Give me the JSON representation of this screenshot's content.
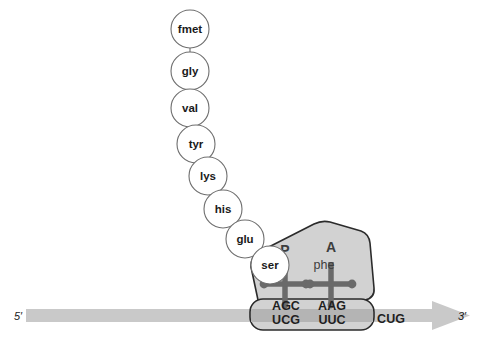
{
  "diagram": {
    "polypeptide": {
      "name": "growing-polypeptide-chain",
      "residues": [
        {
          "label": "fmet",
          "cx": 190,
          "cy": 29
        },
        {
          "label": "gly",
          "cx": 190,
          "cy": 71
        },
        {
          "label": "val",
          "cx": 190,
          "cy": 108
        },
        {
          "label": "tyr",
          "cx": 196,
          "cy": 144
        },
        {
          "label": "lys",
          "cx": 208,
          "cy": 176
        },
        {
          "label": "his",
          "cx": 223,
          "cy": 209
        },
        {
          "label": "glu",
          "cx": 245,
          "cy": 239
        },
        {
          "label": "ser",
          "cx": 270,
          "cy": 265
        }
      ],
      "radius": 19
    },
    "ribosome": {
      "large_subunit_name": "ribosome-large-subunit",
      "small_subunit_name": "ribosome-small-subunit",
      "sites": [
        {
          "id": "P",
          "label": "P",
          "x": 285,
          "y": 252
        },
        {
          "id": "A",
          "label": "A",
          "x": 331,
          "y": 249
        }
      ],
      "incoming_amino_acid": {
        "label": "phe",
        "x": 325,
        "y": 266
      }
    },
    "trnas": [
      {
        "name": "trna-p-site",
        "cx": 285,
        "cy": 285,
        "anticodon": "AGC"
      },
      {
        "name": "trna-a-site",
        "cx": 331,
        "cy": 285,
        "anticodon": "AAG"
      }
    ],
    "anticodons": [
      {
        "text": "AGC",
        "x": 286,
        "y": 309
      },
      {
        "text": "AAG",
        "x": 332,
        "y": 309
      }
    ],
    "codons": [
      {
        "text": "UCG",
        "x": 286,
        "y": 322
      },
      {
        "text": "UUC",
        "x": 332,
        "y": 322
      },
      {
        "text": "CUG",
        "x": 384,
        "y": 320
      }
    ],
    "mrna": {
      "name": "mrna-strand",
      "five_prime_label": "5′",
      "three_prime_label": "3′",
      "five_prime_x": 14,
      "three_prime_x": 464,
      "y": 315
    },
    "colors": {
      "mrna_band": "#c9c9c9",
      "ribosome_fill": "#d2d2d2",
      "ribosome_stroke": "#2b2b2b",
      "trna": "#6a6a6a",
      "circle_stroke": "#6e6e6e",
      "text": "#1a1a1a",
      "background": "#ffffff"
    }
  }
}
